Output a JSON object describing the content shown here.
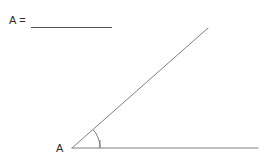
{
  "page": {
    "background_color": "#ffffff",
    "width": 268,
    "height": 159
  },
  "answer": {
    "prompt_label": "A =",
    "blank_value": "",
    "blank_line_color": "#555555"
  },
  "figure": {
    "type": "angle",
    "vertex_label": "A",
    "stroke_color": "#808080",
    "stroke_width": 1,
    "vertex": {
      "x": 72,
      "y": 148
    },
    "rays": [
      {
        "name": "horizontal-ray",
        "from_x": 72,
        "from_y": 148,
        "to_x": 258,
        "to_y": 148
      },
      {
        "name": "diagonal-ray",
        "from_x": 72,
        "from_y": 148,
        "to_x": 208,
        "to_y": 28
      }
    ],
    "arc": {
      "name": "angle-arc",
      "radius": 28,
      "start_x": 100,
      "start_y": 148,
      "end_x": 93,
      "end_y": 124
    },
    "arc_tick": {
      "name": "arc-base-tick",
      "from_x": 100,
      "from_y": 141,
      "to_x": 100,
      "to_y": 148
    }
  }
}
